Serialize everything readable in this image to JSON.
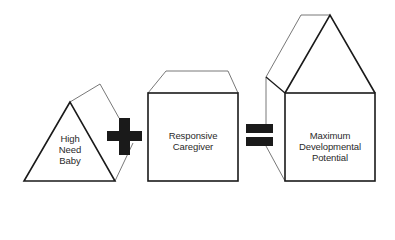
{
  "diagram": {
    "shapes": [
      {
        "id": "triangle",
        "label_lines": [
          "High",
          "Need",
          "Baby"
        ]
      },
      {
        "id": "box",
        "label_lines": [
          "Responsive",
          "Caregiver"
        ]
      },
      {
        "id": "house",
        "label_lines": [
          "Maximum",
          "Developmental",
          "Potential"
        ]
      }
    ],
    "operators": [
      "plus",
      "equals"
    ],
    "colors": {
      "stroke": "#1a1a1a",
      "thin_stroke": "#555555",
      "operator_fill": "#1a1a1a",
      "background": "#ffffff"
    }
  }
}
